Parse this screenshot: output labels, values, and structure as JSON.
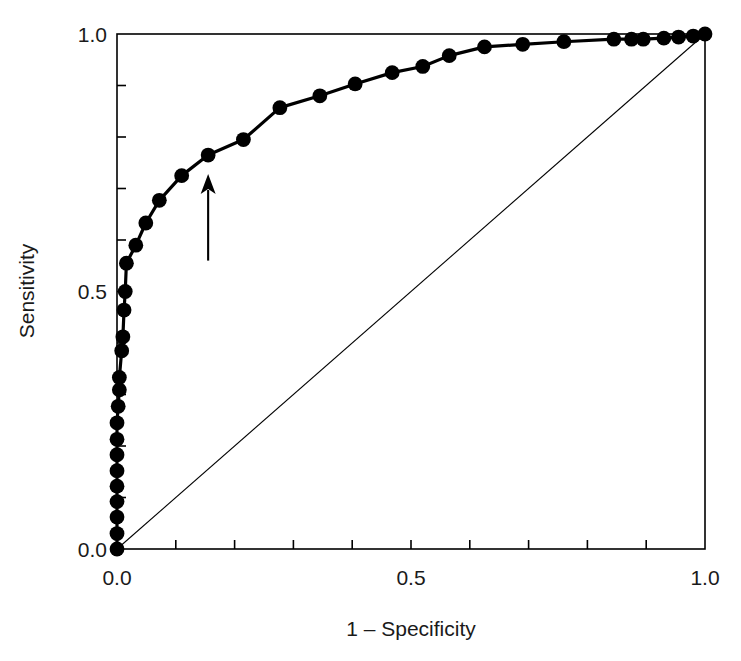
{
  "chart_data": {
    "type": "line",
    "title": "",
    "subtitle": "",
    "xlabel": "1 – Specificity",
    "ylabel": "Sensitivity",
    "xlim": [
      0.0,
      1.0
    ],
    "ylim": [
      0.0,
      1.0
    ],
    "grid": false,
    "legend": null,
    "legend_position": "none",
    "x_tick_labels": [
      "0.0",
      "0.5",
      "1.0"
    ],
    "x_tick_values": [
      0.0,
      0.5,
      1.0
    ],
    "y_tick_labels": [
      "0.0",
      "0.5",
      "1.0"
    ],
    "y_tick_values": [
      0.0,
      0.5,
      1.0
    ],
    "x_minor_tick_values": [
      0.1,
      0.2,
      0.3,
      0.4,
      0.6,
      0.7,
      0.8,
      0.9
    ],
    "y_minor_tick_values": [
      0.1,
      0.2,
      0.3,
      0.4,
      0.6,
      0.7,
      0.8,
      0.9
    ],
    "series": [
      {
        "name": "ROC curve",
        "marker": "filled-circle",
        "marker_color": "#000000",
        "line_color": "#000000",
        "line_width": 3.2,
        "points": [
          [
            0.0,
            0.0
          ],
          [
            0.0,
            0.03
          ],
          [
            0.0,
            0.062
          ],
          [
            0.0,
            0.092
          ],
          [
            0.0,
            0.122
          ],
          [
            0.0,
            0.152
          ],
          [
            0.0,
            0.183
          ],
          [
            0.0,
            0.213
          ],
          [
            0.0,
            0.245
          ],
          [
            0.002,
            0.277
          ],
          [
            0.004,
            0.309
          ],
          [
            0.004,
            0.333
          ],
          [
            0.008,
            0.385
          ],
          [
            0.01,
            0.412
          ],
          [
            0.012,
            0.464
          ],
          [
            0.014,
            0.5
          ],
          [
            0.016,
            0.555
          ],
          [
            0.032,
            0.59
          ],
          [
            0.049,
            0.633
          ],
          [
            0.072,
            0.677
          ],
          [
            0.11,
            0.725
          ],
          [
            0.155,
            0.765
          ],
          [
            0.215,
            0.795
          ],
          [
            0.277,
            0.857
          ],
          [
            0.345,
            0.88
          ],
          [
            0.405,
            0.903
          ],
          [
            0.468,
            0.925
          ],
          [
            0.52,
            0.937
          ],
          [
            0.565,
            0.958
          ],
          [
            0.625,
            0.975
          ],
          [
            0.69,
            0.98
          ],
          [
            0.76,
            0.985
          ],
          [
            0.845,
            0.99
          ],
          [
            0.875,
            0.99
          ],
          [
            0.895,
            0.99
          ],
          [
            0.93,
            0.992
          ],
          [
            0.955,
            0.994
          ],
          [
            0.98,
            0.996
          ],
          [
            1.0,
            1.0
          ]
        ]
      },
      {
        "name": "chance diagonal",
        "marker": "none",
        "marker_color": "#000000",
        "line_color": "#000000",
        "line_width": 1.1,
        "points": [
          [
            0.0,
            0.0
          ],
          [
            1.0,
            1.0
          ]
        ]
      }
    ],
    "annotations": [
      {
        "kind": "arrow",
        "label": "",
        "points_to": [
          0.155,
          0.765
        ],
        "tail": [
          0.155,
          0.56
        ],
        "color": "#000000"
      }
    ]
  },
  "axes": {
    "x_axis_name": "1 – Specificity",
    "y_axis_name": "Sensitivity",
    "frame_color": "#000000"
  }
}
